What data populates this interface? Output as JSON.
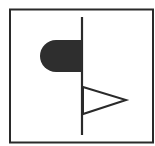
{
  "diagram": {
    "title": "",
    "symbol": "valve-actuator-symbol",
    "elements": [
      {
        "name": "outer-frame",
        "kind": "rectangle"
      },
      {
        "name": "stem-line",
        "kind": "line"
      },
      {
        "name": "actuator-dome",
        "kind": "half-rounded-filled-shape"
      },
      {
        "name": "flag-triangle",
        "kind": "triangle-outline"
      }
    ],
    "colors": {
      "stroke": "#2a2a2a",
      "fill": "#2e2e2e",
      "background": "#ffffff"
    }
  }
}
